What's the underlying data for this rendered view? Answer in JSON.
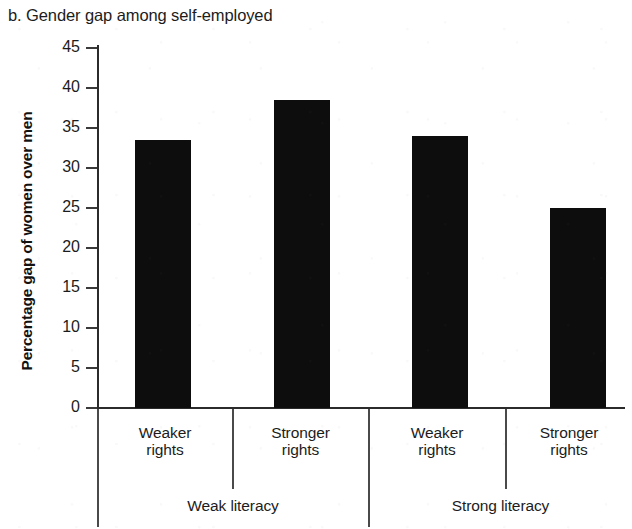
{
  "chart_data": {
    "type": "bar",
    "title": "b. Gender gap among self-employed",
    "xlabel": "",
    "ylabel": "Percentage gap of women over men",
    "ylim": [
      0,
      45
    ],
    "yticks": [
      0,
      5,
      10,
      15,
      20,
      25,
      30,
      35,
      40,
      45
    ],
    "grid": false,
    "legend": null,
    "categories": [
      "Weaker rights",
      "Stronger rights",
      "Weaker rights",
      "Stronger rights"
    ],
    "values": [
      33.5,
      38.5,
      34.0,
      25.0
    ],
    "group_labels": [
      "Weak literacy",
      "Strong literacy"
    ],
    "groups": [
      {
        "label": "Weak literacy",
        "categories": [
          "Weaker rights",
          "Stronger rights"
        ],
        "values": [
          33.5,
          38.5
        ]
      },
      {
        "label": "Strong literacy",
        "categories": [
          "Weaker rights",
          "Stronger rights"
        ],
        "values": [
          34.0,
          25.0
        ]
      }
    ],
    "bar_color": "#0d0d0d",
    "axis_color": "#2b2b2b"
  },
  "yticks": {
    "t0": "0",
    "t5": "5",
    "t10": "10",
    "t15": "15",
    "t20": "20",
    "t25": "25",
    "t30": "30",
    "t35": "35",
    "t40": "40",
    "t45": "45"
  },
  "cat_labels": {
    "c0_line1": "Weaker",
    "c0_line2": "rights",
    "c1_line1": "Stronger",
    "c1_line2": "rights",
    "c2_line1": "Weaker",
    "c2_line2": "rights",
    "c3_line1": "Stronger",
    "c3_line2": "rights"
  },
  "group_labels": {
    "g0": "Weak literacy",
    "g1": "Strong literacy"
  }
}
